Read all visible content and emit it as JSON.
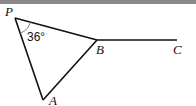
{
  "diagram": {
    "points": {
      "P": {
        "label": "P",
        "x": 15,
        "y": 18
      },
      "B": {
        "label": "B",
        "x": 97,
        "y": 40
      },
      "C": {
        "label": "C",
        "x": 177,
        "y": 40
      },
      "A": {
        "label": "A",
        "x": 43,
        "y": 100
      }
    },
    "segments": [
      [
        "P",
        "B"
      ],
      [
        "B",
        "C"
      ],
      [
        "P",
        "A"
      ],
      [
        "A",
        "B"
      ]
    ],
    "angle": {
      "vertex": "P",
      "label": "36°"
    },
    "colors": {
      "line": "#111111",
      "arc": "#888888",
      "topbar": "#8a8a8a"
    }
  }
}
